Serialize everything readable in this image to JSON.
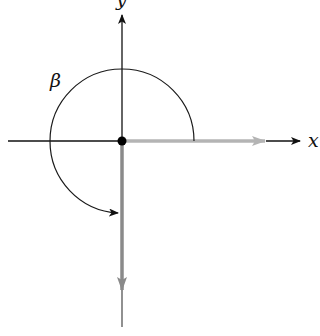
{
  "diagram": {
    "type": "angle-in-standard-position",
    "axes": {
      "x_label": "x",
      "y_label": "y"
    },
    "angle_label": "β",
    "initial_side": "positive x-axis",
    "terminal_side": "negative y-axis",
    "angle_sweep": "counterclockwise, 270°",
    "colors": {
      "axis": "#111111",
      "initial_side": "#b4b4b4",
      "terminal_side": "#8a8a8a",
      "arc": "#1a1a1a"
    }
  }
}
